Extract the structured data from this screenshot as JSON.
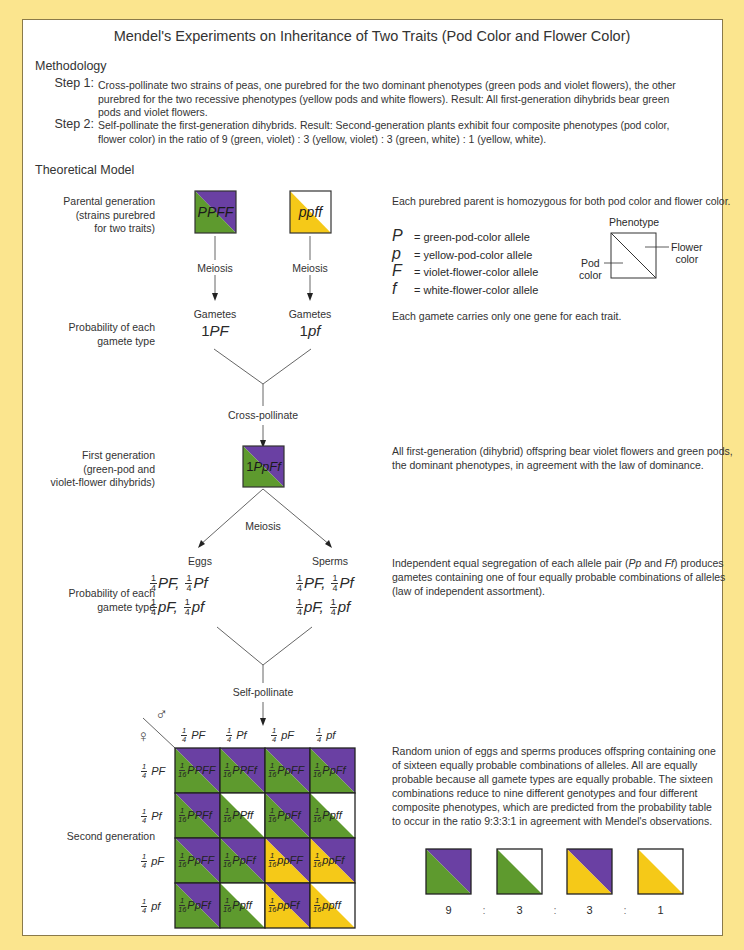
{
  "title": "Mendel's Experiments on Inheritance of Two Traits (Pod Color and Flower Color)",
  "colors": {
    "background": "#fbe58e",
    "panel": "#ffffff",
    "green": "#5e9a2e",
    "violet": "#6a40a3",
    "yellow": "#f5c918",
    "white": "#ffffff"
  },
  "methodology": {
    "heading": "Methodology",
    "steps": [
      {
        "label": "Step 1:",
        "lines": [
          "Cross-pollinate two strains of peas, one purebred for the two dominant phenotypes (green pods and violet flowers), the other",
          "purebred for the two recessive phenotypes (yellow pods and white flowers).  Result:  All first-generation dihybrids bear green",
          "pods and violet flowers."
        ]
      },
      {
        "label": "Step 2:",
        "lines": [
          "Self-pollinate the first-generation dihybrids.  Result:  Second-generation plants exhibit four composite phenotypes (pod color,",
          "flower color) in the ratio of 9 (green, violet) : 3 (yellow, violet) : 3 (green, white) : 1 (yellow, white)."
        ]
      }
    ]
  },
  "model": {
    "heading": "Theoretical Model",
    "left_labels": {
      "parental": [
        "Parental generation",
        "(strains purebred",
        "for two traits)"
      ],
      "prob1": [
        "Probability of each",
        "gamete type"
      ],
      "first_gen": [
        "First generation",
        "(green-pod and",
        "violet-flower dihybrids)"
      ],
      "prob2": [
        "Probability of each",
        "gamete type"
      ],
      "second_gen": "Second generation"
    },
    "parents": [
      {
        "genotype": "PPFF",
        "pod": "green",
        "flower": "violet"
      },
      {
        "genotype": "ppff",
        "pod": "yellow",
        "flower": "white"
      }
    ],
    "meiosis": "Meiosis",
    "gametes_label": "Gametes",
    "parent_gametes": [
      {
        "count": "1",
        "allele": "PF"
      },
      {
        "count": "1",
        "allele": "pf"
      }
    ],
    "cross_pollinate": "Cross-pollinate",
    "f1": {
      "count": "1",
      "genotype": "PpFf"
    },
    "eggs": "Eggs",
    "sperms": "Sperms",
    "gamete_fractions": [
      {
        "num": "1",
        "den": "4",
        "allele": "PF,"
      },
      {
        "num": "1",
        "den": "4",
        "allele": "Pf"
      },
      {
        "num": "1",
        "den": "4",
        "allele": "pF,"
      },
      {
        "num": "1",
        "den": "4",
        "allele": "pf"
      }
    ],
    "self_pollinate": "Self-pollinate",
    "male_symbol": "♂",
    "female_symbol": "♀",
    "punnett": {
      "col_headers": [
        {
          "num": "1",
          "den": "4",
          "allele": "PF"
        },
        {
          "num": "1",
          "den": "4",
          "allele": "Pf"
        },
        {
          "num": "1",
          "den": "4",
          "allele": "pF"
        },
        {
          "num": "1",
          "den": "4",
          "allele": "pf"
        }
      ],
      "row_headers": [
        {
          "num": "1",
          "den": "4",
          "allele": "PF"
        },
        {
          "num": "1",
          "den": "4",
          "allele": "Pf"
        },
        {
          "num": "1",
          "den": "4",
          "allele": "pF"
        },
        {
          "num": "1",
          "den": "4",
          "allele": "pf"
        }
      ],
      "cells": [
        [
          {
            "genotype": "PPFF",
            "pod": "green",
            "flower": "violet"
          },
          {
            "genotype": "PPFf",
            "pod": "green",
            "flower": "violet"
          },
          {
            "genotype": "PpFF",
            "pod": "green",
            "flower": "violet"
          },
          {
            "genotype": "PpFf",
            "pod": "green",
            "flower": "violet"
          }
        ],
        [
          {
            "genotype": "PPFf",
            "pod": "green",
            "flower": "violet"
          },
          {
            "genotype": "PPff",
            "pod": "green",
            "flower": "white"
          },
          {
            "genotype": "PpFf",
            "pod": "green",
            "flower": "violet"
          },
          {
            "genotype": "Ppff",
            "pod": "green",
            "flower": "white"
          }
        ],
        [
          {
            "genotype": "PpFF",
            "pod": "green",
            "flower": "violet"
          },
          {
            "genotype": "PpFf",
            "pod": "green",
            "flower": "violet"
          },
          {
            "genotype": "ppFF",
            "pod": "yellow",
            "flower": "violet"
          },
          {
            "genotype": "ppFf",
            "pod": "yellow",
            "flower": "violet"
          }
        ],
        [
          {
            "genotype": "PpFf",
            "pod": "green",
            "flower": "violet"
          },
          {
            "genotype": "Ppff",
            "pod": "green",
            "flower": "white"
          },
          {
            "genotype": "ppFf",
            "pod": "yellow",
            "flower": "violet"
          },
          {
            "genotype": "ppff",
            "pod": "yellow",
            "flower": "white"
          }
        ]
      ],
      "cell_fraction": {
        "num": "1",
        "den": "16"
      }
    }
  },
  "descriptions": {
    "parental": "Each purebred parent is homozygous for both pod color and flower color.",
    "alleles": [
      {
        "symbol": "P",
        "meaning": "=  green-pod-color allele"
      },
      {
        "symbol": "p",
        "meaning": "=  yellow-pod-color allele"
      },
      {
        "symbol": "F",
        "meaning": "=  violet-flower-color allele"
      },
      {
        "symbol": "f",
        "meaning": "=  white-flower-color allele"
      }
    ],
    "key": {
      "title": "Phenotype",
      "pod": [
        "Pod",
        "color"
      ],
      "flower": [
        "Flower",
        "color"
      ]
    },
    "gamete": "Each gamete carries only one gene for each trait.",
    "first_gen": "All first-generation (dihybrid) offspring bear violet flowers and green pods, the dominant phenotypes, in agreement with the law of dominance.",
    "segregation_pre": "Independent equal segregation of each allele pair (",
    "segregation_pp": "Pp",
    "segregation_and": " and ",
    "segregation_ff": "Ff",
    "segregation_post": ") produces gametes containing one of four equally probable combinations of alleles (law of independent assortment).",
    "second_gen": "Random union of eggs and sperms produces offspring containing one of sixteen equally probable combinations of alleles.  All are equally probable because all gamete types are equally probable. The sixteen combinations reduce to nine different genotypes and four different composite phenotypes, which are predicted from the probability table to occur in the ratio 9:3:3:1 in agreement with Mendel's observations."
  },
  "phenotype_ratio": {
    "items": [
      {
        "pod": "green",
        "flower": "violet",
        "count": "9"
      },
      {
        "pod": "green",
        "flower": "white",
        "count": "3"
      },
      {
        "pod": "yellow",
        "flower": "violet",
        "count": "3"
      },
      {
        "pod": "yellow",
        "flower": "white",
        "count": "1"
      }
    ],
    "separator": ":"
  }
}
